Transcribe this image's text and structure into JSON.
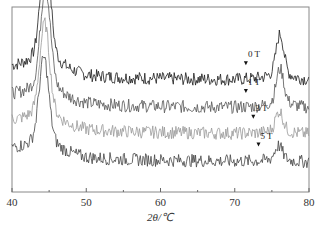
{
  "chart_data": {
    "type": "line",
    "title": "",
    "xlabel": "2θ/℃",
    "ylabel": "",
    "xlim": [
      40,
      80
    ],
    "x_ticks": [
      "40",
      "50",
      "60",
      "70",
      "80"
    ],
    "grid": false,
    "legend": "none (inline annotations)",
    "series": [
      {
        "name": "0 T",
        "color": "#1a1a1a",
        "baseline": 0.62,
        "peaks": [
          {
            "x": 44.5,
            "height": 0.55
          },
          {
            "x": 76.1,
            "height": 0.2
          }
        ]
      },
      {
        "name": "1 T",
        "color": "#555555",
        "baseline": 0.47,
        "peaks": [
          {
            "x": 44.5,
            "height": 0.5
          },
          {
            "x": 76.1,
            "height": 0.17
          }
        ]
      },
      {
        "name": "3 T",
        "color": "#999999",
        "baseline": 0.33,
        "peaks": [
          {
            "x": 44.4,
            "height": 0.45
          },
          {
            "x": 76.0,
            "height": 0.1
          }
        ]
      },
      {
        "name": "5 T",
        "color": "#444444",
        "baseline": 0.18,
        "peaks": [
          {
            "x": 44.3,
            "height": 0.42
          },
          {
            "x": 75.9,
            "height": 0.07
          }
        ]
      }
    ],
    "annotations": [
      {
        "text": "0 T",
        "x": 71.5
      },
      {
        "text": "1 T",
        "x": 71.5
      },
      {
        "text": "3 T",
        "x": 72.5
      },
      {
        "text": "5 T",
        "x": 73.2
      }
    ]
  }
}
